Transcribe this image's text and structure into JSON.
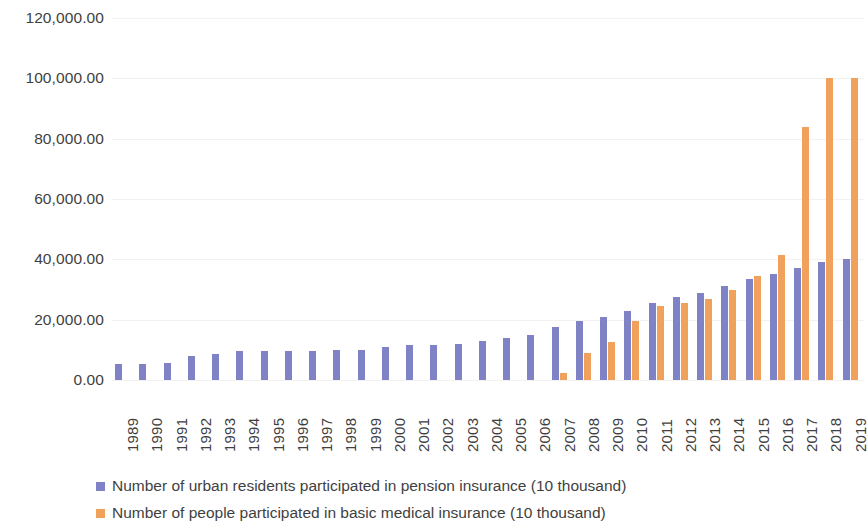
{
  "chart_data": {
    "type": "bar",
    "title": "",
    "subtitle": "",
    "xlabel": "",
    "ylabel": "",
    "ylim": [
      0,
      120000
    ],
    "ytick_labels": [
      "120,000.00",
      "100,000.00",
      "80,000.00",
      "60,000.00",
      "40,000.00",
      "20,000.00",
      "0.00"
    ],
    "ytick_values": [
      120000,
      100000,
      80000,
      60000,
      40000,
      20000,
      0
    ],
    "grid": true,
    "legend_position": "bottom",
    "categories": [
      "1989",
      "1990",
      "1991",
      "1992",
      "1993",
      "1994",
      "1995",
      "1996",
      "1997",
      "1998",
      "1999",
      "2000",
      "2001",
      "2002",
      "2003",
      "2004",
      "2005",
      "2006",
      "2007",
      "2008",
      "2009",
      "2010",
      "2011",
      "2012",
      "2013",
      "2014",
      "2015",
      "2016",
      "2017",
      "2018",
      "2019"
    ],
    "series": [
      {
        "name": "Number of urban residents participated in pension insurance (10 thousand)",
        "color": "#7f83c6",
        "values": [
          5200,
          5200,
          5700,
          7800,
          8700,
          9500,
          9500,
          9500,
          9500,
          9800,
          10000,
          11000,
          11500,
          11500,
          12000,
          13000,
          14000,
          15000,
          17500,
          19500,
          21000,
          23000,
          25500,
          27500,
          29000,
          31000,
          33500,
          35000,
          37000,
          39000,
          40000
        ]
      },
      {
        "name": "Number of people participated in basic medical insurance (10 thousand)",
        "color": "#f0a15b",
        "values": [
          0,
          0,
          0,
          0,
          0,
          0,
          0,
          0,
          0,
          0,
          0,
          0,
          0,
          0,
          0,
          0,
          0,
          0,
          2300,
          9000,
          12500,
          19500,
          24500,
          25500,
          27000,
          30000,
          34500,
          41500,
          84000,
          100000,
          100000
        ]
      }
    ]
  },
  "legend": {
    "items": [
      {
        "label": "Number of urban residents participated in pension insurance (10 thousand)",
        "swatch": "pension-swatch"
      },
      {
        "label": "Number of people participated in basic medical insurance (10 thousand)",
        "swatch": "medical-swatch"
      }
    ]
  }
}
